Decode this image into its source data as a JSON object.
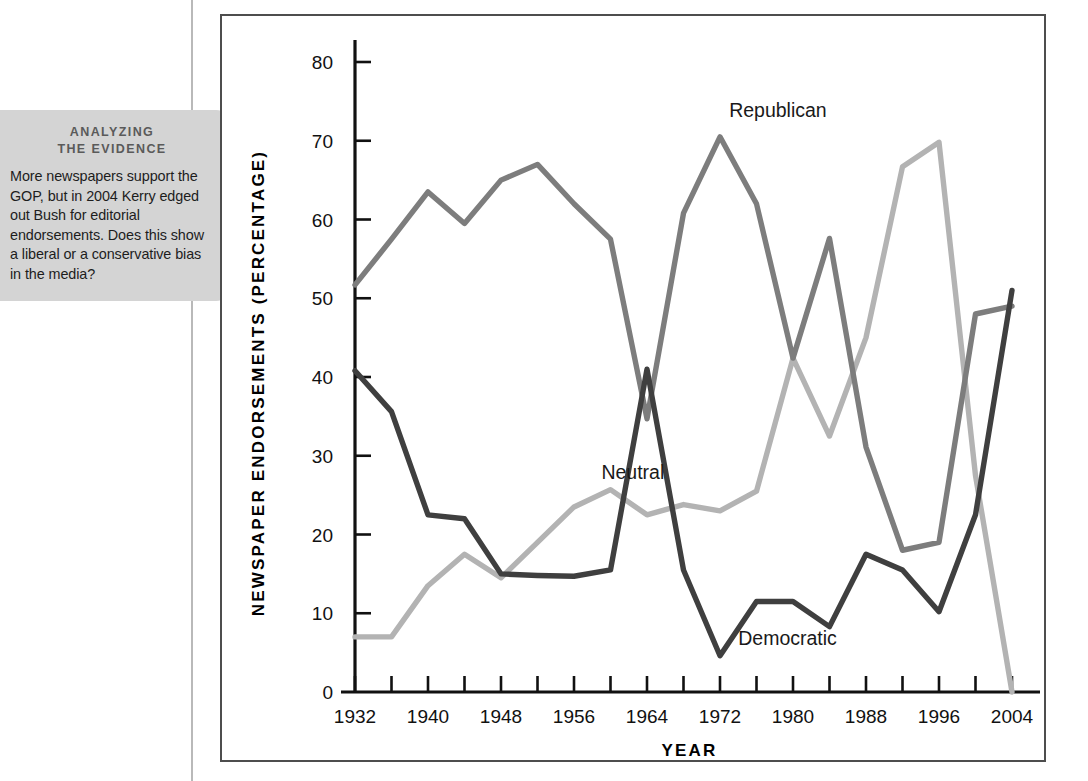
{
  "callout": {
    "heading_line1": "ANALYZING",
    "heading_line2": "THE EVIDENCE",
    "body": "More newspapers support the GOP, but in 2004 Kerry edged out Bush for editorial endorsements. Does this show a liberal or a conservative bias in the media?"
  },
  "colors": {
    "republican": "#7d7d7d",
    "democratic": "#3f3f3f",
    "neutral": "#b3b3b3",
    "axis": "#111111",
    "frame": "#4d4d4d",
    "callout_bg": "#d4d4d4"
  },
  "chart_data": {
    "type": "line",
    "title": "",
    "xlabel": "YEAR",
    "ylabel": "NEWSPAPER ENDORSEMENTS (PERCENTAGE)",
    "xlim": [
      1932,
      2004
    ],
    "ylim": [
      0,
      80
    ],
    "ytick_step": 10,
    "yticks": [
      0,
      10,
      20,
      30,
      40,
      50,
      60,
      70,
      80
    ],
    "xtick_step": 4,
    "xtick_labels": [
      "1932",
      "1940",
      "1948",
      "1956",
      "1964",
      "1972",
      "1980",
      "1988",
      "1996",
      "2004"
    ],
    "xtick_label_step": 8,
    "grid": false,
    "legend": "inline-annotations",
    "x": [
      1932,
      1936,
      1940,
      1944,
      1948,
      1952,
      1956,
      1960,
      1964,
      1968,
      1972,
      1976,
      1980,
      1984,
      1988,
      1992,
      1996,
      2000,
      2004
    ],
    "series": [
      {
        "name": "Republican",
        "color": "#7d7d7d",
        "label_x": 1973,
        "label_y": 73,
        "values": [
          51.7,
          57.5,
          63.5,
          59.5,
          65.0,
          67.0,
          62.0,
          57.5,
          34.7,
          60.8,
          70.5,
          62.0,
          42.4,
          57.6,
          31.1,
          18.0,
          19.0,
          48.0,
          49.0
        ]
      },
      {
        "name": "Democratic",
        "color": "#3f3f3f",
        "label_x": 1974,
        "label_y": 6,
        "values": [
          40.8,
          35.6,
          22.5,
          22.0,
          15.0,
          14.8,
          14.7,
          15.5,
          41.0,
          15.5,
          4.6,
          11.5,
          11.5,
          8.3,
          17.5,
          15.5,
          10.2,
          22.5,
          51.0
        ]
      },
      {
        "name": "Neutral",
        "color": "#b3b3b3",
        "label_x": 1959,
        "label_y": 27,
        "values": [
          7.0,
          7.0,
          13.5,
          17.5,
          14.5,
          19.0,
          23.5,
          25.7,
          22.5,
          23.8,
          23.0,
          25.5,
          42.4,
          32.5,
          45.0,
          66.7,
          69.8,
          27.5,
          0.0
        ]
      }
    ]
  }
}
